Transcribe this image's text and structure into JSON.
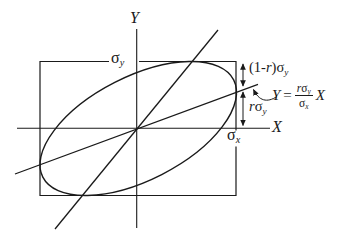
{
  "figure": {
    "ink_color": "#1a1a1a",
    "background_color": "#ffffff"
  },
  "labels": {
    "y_axis": "Y",
    "x_axis": "X",
    "sigma_y": {
      "base": "σ",
      "sub": "y"
    },
    "sigma_x": {
      "base": "σ",
      "sub": "x"
    },
    "one_minus_r_sigma_y": {
      "pre": "(1-",
      "r": "r",
      "post": ")σ",
      "sub": "y"
    },
    "r_sigma_y": {
      "r": "r",
      "sigma": "σ",
      "sub": "y"
    },
    "equation": {
      "lhs": "Y",
      "eq": "=",
      "num_r": "r",
      "num_sigma": "σ",
      "num_sub": "y",
      "den_sigma": "σ",
      "den_sub": "x",
      "rhs": "X"
    }
  }
}
